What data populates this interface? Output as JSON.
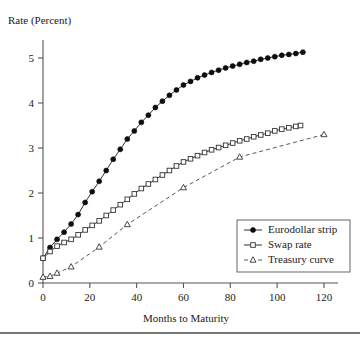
{
  "chart_data": {
    "type": "line",
    "title": "",
    "xlabel": "Months to Maturity",
    "ylabel": "Rate (Percent)",
    "xlim": [
      0,
      126
    ],
    "ylim": [
      0,
      5.4
    ],
    "xticks": [
      0,
      20,
      40,
      60,
      80,
      100,
      120
    ],
    "xtick_labels": [
      "0",
      "20",
      "40",
      "60",
      "80",
      "100",
      "120"
    ],
    "yticks": [
      0,
      1,
      2,
      3,
      4,
      5
    ],
    "ytick_labels": [
      "0",
      "1",
      "2",
      "3",
      "4",
      "5"
    ],
    "grid": false,
    "legend_position": "lower-right",
    "series": [
      {
        "name": "Eurodollar strip",
        "marker": "filled-circle",
        "line_style": "solid",
        "color": "#0d0d0d",
        "x": [
          0,
          3,
          6,
          9,
          12,
          15,
          18,
          21,
          24,
          27,
          30,
          33,
          36,
          39,
          42,
          45,
          48,
          51,
          54,
          57,
          60,
          63,
          66,
          69,
          72,
          75,
          78,
          81,
          84,
          87,
          90,
          93,
          96,
          99,
          102,
          105,
          108,
          111
        ],
        "y": [
          0.55,
          0.79,
          0.97,
          1.13,
          1.31,
          1.52,
          1.79,
          2.03,
          2.26,
          2.5,
          2.75,
          2.97,
          3.2,
          3.38,
          3.57,
          3.73,
          3.9,
          4.04,
          4.17,
          4.29,
          4.4,
          4.48,
          4.56,
          4.62,
          4.68,
          4.73,
          4.78,
          4.82,
          4.86,
          4.9,
          4.93,
          4.97,
          5.0,
          5.03,
          5.06,
          5.08,
          5.1,
          5.13
        ]
      },
      {
        "name": "Swap rate",
        "marker": "open-square",
        "line_style": "solid",
        "color": "#333333",
        "x": [
          0,
          3,
          6,
          9,
          12,
          15,
          18,
          21,
          24,
          27,
          30,
          33,
          36,
          39,
          42,
          45,
          48,
          51,
          54,
          57,
          60,
          63,
          66,
          69,
          72,
          75,
          78,
          81,
          84,
          87,
          90,
          93,
          96,
          99,
          102,
          105,
          108,
          110
        ],
        "y": [
          0.55,
          0.7,
          0.82,
          0.9,
          0.97,
          1.07,
          1.18,
          1.28,
          1.38,
          1.5,
          1.62,
          1.74,
          1.86,
          1.98,
          2.1,
          2.2,
          2.3,
          2.4,
          2.5,
          2.6,
          2.69,
          2.76,
          2.83,
          2.9,
          2.96,
          3.01,
          3.06,
          3.11,
          3.16,
          3.2,
          3.25,
          3.29,
          3.33,
          3.38,
          3.42,
          3.45,
          3.48,
          3.5
        ]
      },
      {
        "name": "Treasury curve",
        "marker": "open-triangle",
        "line_style": "dashed",
        "color": "#444444",
        "x": [
          0,
          3,
          6,
          12,
          24,
          36,
          60,
          84,
          120
        ],
        "y": [
          0.13,
          0.15,
          0.22,
          0.36,
          0.8,
          1.3,
          2.12,
          2.8,
          3.3
        ]
      }
    ]
  },
  "legend": {
    "entries": [
      {
        "label": "Eurodollar strip",
        "marker_name": "filled-circle-marker"
      },
      {
        "label": "Swap rate",
        "marker_name": "open-square-marker"
      },
      {
        "label": "Treasury curve",
        "marker_name": "open-triangle-marker"
      }
    ]
  }
}
